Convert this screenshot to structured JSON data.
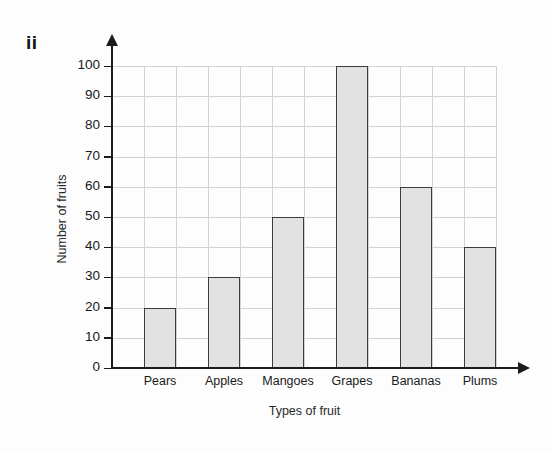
{
  "figure": {
    "part_label": "ii",
    "background_color": "#fdfdfd"
  },
  "chart_data": {
    "type": "bar",
    "title": "",
    "subtitle": "",
    "xlabel": "Types of fruit",
    "ylabel": "Number of fruits",
    "categories": [
      "Pears",
      "Apples",
      "Mangoes",
      "Grapes",
      "Bananas",
      "Plums"
    ],
    "values": [
      20,
      30,
      50,
      100,
      60,
      40
    ],
    "ylim": [
      0,
      100
    ],
    "ytick_labels": [
      "0",
      "10",
      "20",
      "30",
      "40",
      "50",
      "60",
      "70",
      "80",
      "90",
      "100"
    ],
    "ytick_values": [
      0,
      10,
      20,
      30,
      40,
      50,
      60,
      70,
      80,
      90,
      100
    ],
    "ytick_step": 10,
    "grid": true,
    "grid_color": "#d2d2d2",
    "legend": null,
    "bar_fill_color": "#e2e2e2",
    "bar_border_color": "#3c3c3c",
    "axis_color": "#1c1c1c"
  }
}
